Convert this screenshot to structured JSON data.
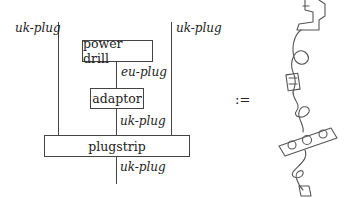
{
  "diagram": {
    "wire_labels": {
      "left_outer": "uk-plug",
      "right_outer": "uk-plug",
      "drill_to_adaptor": "eu-plug",
      "adaptor_to_plugstrip": "uk-plug",
      "plugstrip_output": "uk-plug"
    },
    "boxes": {
      "power_drill": "power drill",
      "adaptor": "adaptor",
      "plugstrip": "plugstrip"
    },
    "equals_symbol": ":=",
    "illustration": "sketch of power drill connected via cable and adaptor to a plugstrip with plug"
  }
}
